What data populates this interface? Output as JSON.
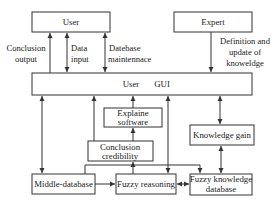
{
  "diagram": {
    "nodes": {
      "user": {
        "label": "User"
      },
      "expert": {
        "label": "Expert"
      },
      "gui": {
        "label_left": "User",
        "label_right": "GUI"
      },
      "explain": {
        "line1": "Explaine",
        "line2": "software"
      },
      "credibility": {
        "line1": "Conclusion",
        "line2": "credibility"
      },
      "knowledge_gain": {
        "label": "Knowledge gain"
      },
      "middle_db": {
        "label": "Middle-database"
      },
      "fuzzy_reasoning": {
        "label": "Fuzzy reasoning"
      },
      "fuzzy_kdb": {
        "line1": "Fuzzy knowledge",
        "line2": "database"
      }
    },
    "edges": {
      "conclusion_output": {
        "line1": "Conclusion",
        "line2": "output"
      },
      "data_input": {
        "line1": "Data",
        "line2": "input"
      },
      "db_maintenance": {
        "line1": "Datebase",
        "line2": "maintennace"
      },
      "expert_definition": {
        "line1": "Definition and",
        "line2": "update of",
        "line3": "knoweldge"
      }
    },
    "colors": {
      "stroke": "#333333",
      "text": "#222222",
      "background": "#ffffff"
    }
  }
}
